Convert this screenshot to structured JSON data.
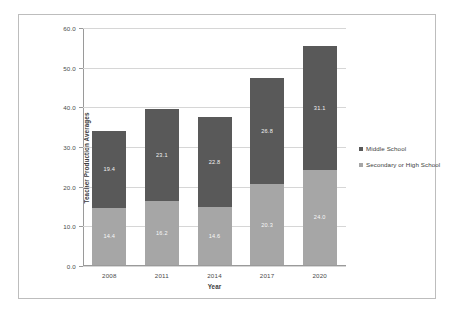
{
  "chart_data": {
    "type": "bar",
    "subtype": "stacked-bar",
    "title": "",
    "xlabel": "Year",
    "ylabel": "Teacher Production Averages",
    "categories": [
      "2008",
      "2011",
      "2014",
      "2017",
      "2020"
    ],
    "ylim": [
      0.0,
      60.0
    ],
    "ytick_labels": [
      "0.0",
      "10.0",
      "20.0",
      "30.0",
      "40.0",
      "50.0",
      "60.0"
    ],
    "ytick_values": [
      0.0,
      10.0,
      20.0,
      30.0,
      40.0,
      50.0,
      60.0
    ],
    "grid": true,
    "legend_position": "right",
    "series": [
      {
        "name": "Secondary or High School",
        "color": "#a6a6a6",
        "stack_order": 0,
        "values": [
          14.4,
          16.2,
          14.6,
          20.3,
          24.0
        ],
        "labels": [
          "14.4",
          "16.2",
          "14.6",
          "20.3",
          "24.0"
        ]
      },
      {
        "name": "Middle School",
        "color": "#595959",
        "stack_order": 1,
        "values": [
          19.4,
          23.1,
          22.8,
          26.8,
          31.1
        ],
        "labels": [
          "19.4",
          "23.1",
          "22.8",
          "26.8",
          "31.1"
        ]
      }
    ],
    "totals": [
      33.8,
      39.3,
      37.4,
      47.1,
      55.1
    ]
  },
  "legend": {
    "items": [
      {
        "label": "Middle School",
        "color": "#595959"
      },
      {
        "label": "Secondary or High School",
        "color": "#a6a6a6"
      }
    ]
  },
  "colors": {
    "middle_school": "#595959",
    "secondary_high_school": "#a6a6a6",
    "gridline": "#d6d6d6",
    "axis": "#9a9a9a",
    "frame_border": "#bdbdbd",
    "background": "#ffffff"
  }
}
